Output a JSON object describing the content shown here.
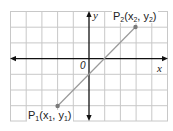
{
  "diagram": {
    "type": "coordinate-plane",
    "grid": {
      "x_range": [
        -5,
        5
      ],
      "y_range": [
        -4,
        3
      ],
      "line_color": "#c8c8c8",
      "axis_color": "#111111"
    },
    "axes": {
      "x_label": "x",
      "y_label": "y",
      "origin_label": "0"
    },
    "segment": {
      "color": "#9a9a9a",
      "from": "P1",
      "to": "P2"
    },
    "points": [
      {
        "id": "P1",
        "label": "P",
        "sub": "1",
        "coord_text_open": "(x",
        "coord_sub_x": "1",
        "coord_mid": ", y",
        "coord_sub_y": "1",
        "coord_close": ")",
        "grid_x": -2,
        "grid_y": -3
      },
      {
        "id": "P2",
        "label": "P",
        "sub": "2",
        "coord_text_open": "(x",
        "coord_sub_x": "2",
        "coord_mid": ", y",
        "coord_sub_y": "2",
        "coord_close": ")",
        "grid_x": 3,
        "grid_y": 2
      }
    ]
  }
}
